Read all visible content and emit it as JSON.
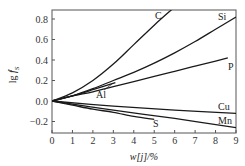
{
  "chart_data": {
    "type": "line",
    "title": "",
    "xlabel": "w[j]/%",
    "ylabel": "lg f_S^j",
    "xlim": [
      0,
      9
    ],
    "ylim": [
      -0.3,
      0.9
    ],
    "xticks": [
      0,
      1,
      2,
      3,
      4,
      5,
      6,
      7,
      8,
      9
    ],
    "yticks": [
      -0.2,
      0.0,
      0.2,
      0.4,
      0.6,
      0.8
    ],
    "ytick_labels": [
      "−0.2",
      "0.0",
      "0.2",
      "0.4",
      "0.6",
      "0.8"
    ],
    "grid": false,
    "legend": "inline labels at curve ends",
    "series": [
      {
        "name": "C",
        "x": [
          0,
          1,
          2,
          3,
          4,
          5,
          5.9
        ],
        "y": [
          0,
          0.08,
          0.2,
          0.36,
          0.55,
          0.74,
          0.9
        ]
      },
      {
        "name": "Si",
        "x": [
          0,
          1,
          2,
          3,
          4,
          5,
          6,
          7,
          8,
          9
        ],
        "y": [
          0,
          0.05,
          0.12,
          0.2,
          0.28,
          0.37,
          0.47,
          0.58,
          0.7,
          0.82
        ]
      },
      {
        "name": "P",
        "x": [
          0,
          1,
          2,
          3,
          4,
          5,
          6,
          7,
          8,
          8.6
        ],
        "y": [
          0,
          0.05,
          0.09,
          0.14,
          0.19,
          0.24,
          0.29,
          0.34,
          0.39,
          0.42
        ]
      },
      {
        "name": "Al",
        "x": [
          0,
          1,
          2,
          3.1
        ],
        "y": [
          0,
          0.05,
          0.11,
          0.18
        ]
      },
      {
        "name": "Cu",
        "x": [
          0,
          3,
          6,
          9
        ],
        "y": [
          0,
          -0.05,
          -0.09,
          -0.12
        ]
      },
      {
        "name": "Mn",
        "x": [
          0,
          3,
          6,
          9
        ],
        "y": [
          0,
          -0.09,
          -0.17,
          -0.26
        ]
      },
      {
        "name": "S",
        "x": [
          0,
          1,
          2,
          3,
          4,
          5
        ],
        "y": [
          0,
          -0.04,
          -0.08,
          -0.11,
          -0.15,
          -0.18
        ]
      }
    ]
  }
}
